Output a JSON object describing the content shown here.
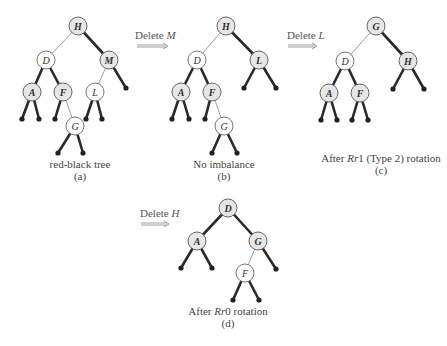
{
  "figure": {
    "panels": [
      {
        "id": "a",
        "caption_line1": "red-black tree",
        "caption_line2": "(a)",
        "nodes": [
          {
            "key": "H",
            "color": "black",
            "x": 78,
            "y": 26
          },
          {
            "key": "D",
            "color": "red",
            "x": 46,
            "y": 60
          },
          {
            "key": "M",
            "color": "black",
            "x": 109,
            "y": 60
          },
          {
            "key": "A",
            "color": "black",
            "x": 32,
            "y": 92
          },
          {
            "key": "F",
            "color": "black",
            "x": 63,
            "y": 92
          },
          {
            "key": "L",
            "color": "red",
            "x": 95,
            "y": 92
          },
          {
            "key": "G",
            "color": "red",
            "x": 75,
            "y": 126
          }
        ]
      },
      {
        "id": "b",
        "operation": "Delete M",
        "caption_line1": "No imbalance",
        "caption_line2": "(b)",
        "nodes": [
          {
            "key": "H",
            "color": "black",
            "x": 226,
            "y": 26
          },
          {
            "key": "D",
            "color": "red",
            "x": 197,
            "y": 60
          },
          {
            "key": "L",
            "color": "black",
            "x": 259,
            "y": 60
          },
          {
            "key": "A",
            "color": "black",
            "x": 181,
            "y": 92
          },
          {
            "key": "F",
            "color": "black",
            "x": 212,
            "y": 92
          },
          {
            "key": "G",
            "color": "red",
            "x": 224,
            "y": 126
          }
        ]
      },
      {
        "id": "c",
        "operation": "Delete L",
        "caption_line1": "After Rr1 (Type 2) rotation",
        "caption_line2": "(c)",
        "nodes": [
          {
            "key": "G",
            "color": "black",
            "x": 376,
            "y": 26
          },
          {
            "key": "D",
            "color": "red",
            "x": 345,
            "y": 61
          },
          {
            "key": "H",
            "color": "black",
            "x": 408,
            "y": 61
          },
          {
            "key": "A",
            "color": "black",
            "x": 329,
            "y": 93
          },
          {
            "key": "F",
            "color": "black",
            "x": 360,
            "y": 93
          }
        ]
      },
      {
        "id": "d",
        "operation": "Delete H",
        "caption_line1": "After Rr0 rotation",
        "caption_line2": "(d)",
        "nodes": [
          {
            "key": "D",
            "color": "black",
            "x": 228,
            "y": 208
          },
          {
            "key": "A",
            "color": "black",
            "x": 197,
            "y": 241
          },
          {
            "key": "G",
            "color": "black",
            "x": 258,
            "y": 241
          },
          {
            "key": "F",
            "color": "red",
            "x": 245,
            "y": 273
          }
        ]
      }
    ],
    "operations": {
      "delete_m": {
        "verb": "Delete",
        "key": "M"
      },
      "delete_l": {
        "verb": "Delete",
        "key": "L"
      },
      "delete_h": {
        "verb": "Delete",
        "key": "H"
      }
    },
    "captions": {
      "a": {
        "line1": "red-black tree",
        "line2": "(a)"
      },
      "b": {
        "line1": "No imbalance",
        "line2": "(b)"
      },
      "c": {
        "prefix": "After ",
        "rot": "Rr",
        "suffix": "1 (Type 2) rotation",
        "line2": "(c)"
      },
      "d": {
        "prefix": "After ",
        "rot": "Rr",
        "suffix": "0 rotation",
        "line2": "(d)"
      }
    },
    "colors": {
      "black_node_fill": "#e6e6e6",
      "red_node_fill": "#ffffff",
      "black_edge": "#2a2a2a",
      "red_edge": "#888888"
    }
  }
}
